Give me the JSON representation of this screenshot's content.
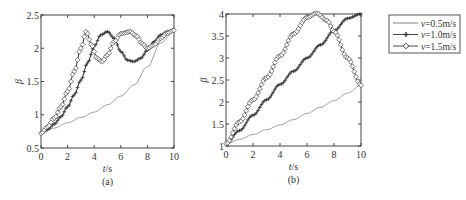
{
  "chart_data": [
    {
      "type": "line",
      "panel_label": "(a)",
      "xlabel": "t/s",
      "ylabel": "β",
      "xlim": [
        0,
        10
      ],
      "ylim": [
        0.5,
        2.5
      ],
      "xticks": [
        "0",
        "2",
        "4",
        "6",
        "8",
        "10"
      ],
      "yticks": [
        "0.5",
        "1",
        "1.5",
        "2",
        "2.5"
      ],
      "grid": false,
      "series": [
        {
          "name": "v=0.5m/s",
          "marker": "none",
          "x": [
            0,
            1,
            2,
            3,
            4,
            5,
            6,
            7,
            8,
            9,
            10
          ],
          "values": [
            0.72,
            0.8,
            0.88,
            0.96,
            1.04,
            1.15,
            1.28,
            1.45,
            1.72,
            2.08,
            2.25
          ]
        },
        {
          "name": "v=1.0m/s",
          "marker": "plus",
          "x": [
            0,
            0.5,
            1,
            1.5,
            2,
            2.5,
            3,
            3.5,
            4,
            4.5,
            5,
            5.5,
            6,
            6.5,
            7,
            7.5,
            8,
            8.5,
            9,
            9.5,
            10
          ],
          "values": [
            0.72,
            0.78,
            0.86,
            0.97,
            1.12,
            1.3,
            1.52,
            1.78,
            2.03,
            2.2,
            2.25,
            2.15,
            1.95,
            1.82,
            1.8,
            1.85,
            1.97,
            2.1,
            2.2,
            2.25,
            2.27
          ]
        },
        {
          "name": "v=1.5m/s",
          "marker": "diamond",
          "x": [
            0,
            0.5,
            1,
            1.5,
            2,
            2.5,
            3,
            3.4,
            3.8,
            4.2,
            4.6,
            5,
            5.5,
            6,
            6.7,
            7.2,
            7.6,
            8,
            8.5,
            9,
            9.5,
            10
          ],
          "values": [
            0.72,
            0.82,
            0.95,
            1.12,
            1.35,
            1.65,
            2.0,
            2.25,
            2.05,
            1.85,
            1.8,
            1.9,
            2.1,
            2.22,
            2.25,
            2.18,
            2.07,
            2.0,
            2.05,
            2.15,
            2.23,
            2.27
          ]
        }
      ]
    },
    {
      "type": "line",
      "panel_label": "(b)",
      "xlabel": "t/s",
      "ylabel": "β",
      "xlim": [
        0,
        10
      ],
      "ylim": [
        1,
        4
      ],
      "xticks": [
        "0",
        "2",
        "4",
        "6",
        "8",
        "10"
      ],
      "yticks": [
        "1",
        "1.5",
        "2",
        "2.5",
        "3",
        "3.5",
        "4"
      ],
      "grid": false,
      "series": [
        {
          "name": "v=0.5m/s",
          "marker": "none",
          "x": [
            0,
            1,
            2,
            3,
            4,
            5,
            6,
            7,
            8,
            9,
            10
          ],
          "values": [
            1.05,
            1.15,
            1.26,
            1.37,
            1.48,
            1.6,
            1.74,
            1.88,
            2.03,
            2.2,
            2.38
          ]
        },
        {
          "name": "v=1.0m/s",
          "marker": "plus",
          "x": [
            0,
            1,
            2,
            3,
            4,
            5,
            6,
            7,
            8,
            9,
            10
          ],
          "values": [
            1.05,
            1.35,
            1.7,
            2.05,
            2.4,
            2.7,
            3.0,
            3.3,
            3.62,
            3.9,
            4.0
          ]
        },
        {
          "name": "v=1.5m/s",
          "marker": "diamond",
          "x": [
            0,
            1,
            2,
            3,
            4,
            5,
            6,
            6.7,
            7.5,
            8,
            9,
            10
          ],
          "values": [
            1.05,
            1.55,
            2.05,
            2.55,
            3.05,
            3.55,
            3.92,
            4.02,
            3.85,
            3.6,
            3.0,
            2.38
          ]
        }
      ]
    }
  ],
  "legend": {
    "entries": [
      "v=0.5m/s",
      "v=1.0m/s",
      "v=1.5m/s"
    ]
  }
}
